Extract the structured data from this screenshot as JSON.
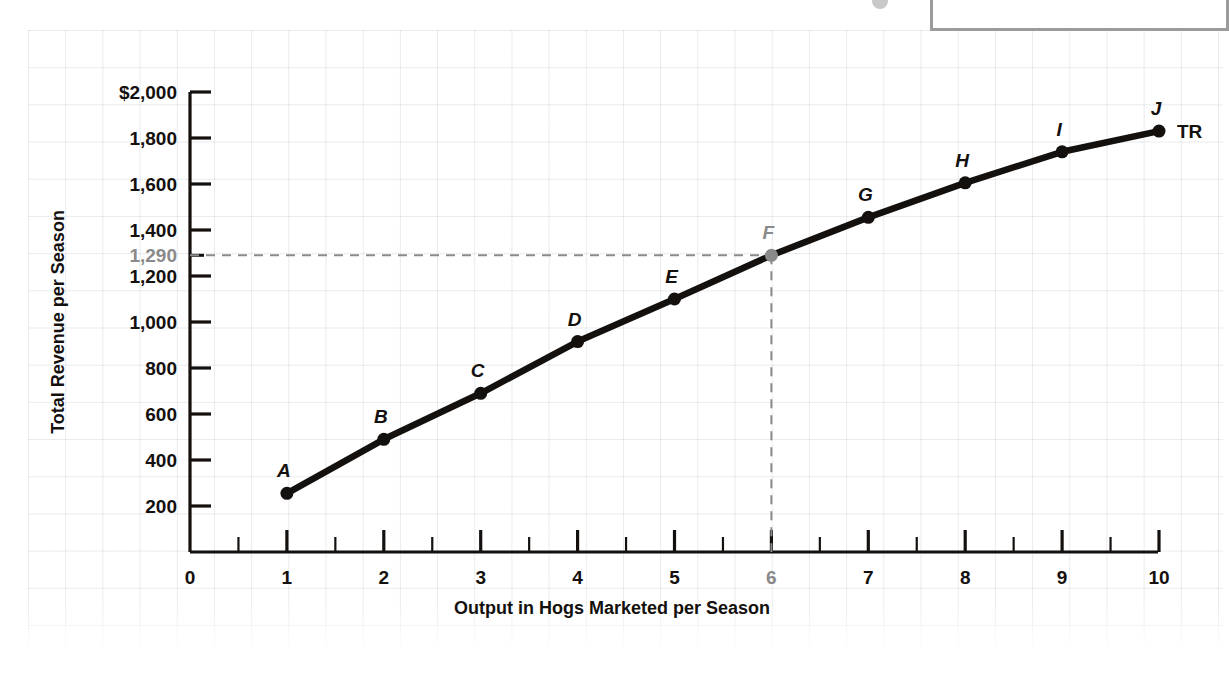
{
  "chart_data": {
    "type": "line",
    "title": "",
    "xlabel": "Output in Hogs Marketed per Season",
    "ylabel": "Total Revenue per Season",
    "series_name": "TR",
    "x": [
      1,
      2,
      3,
      4,
      5,
      6,
      7,
      8,
      9,
      10
    ],
    "values": [
      255,
      490,
      690,
      915,
      1100,
      1290,
      1455,
      1605,
      1740,
      1830
    ],
    "point_labels": [
      "A",
      "B",
      "C",
      "D",
      "E",
      "F",
      "G",
      "H",
      "I",
      "J"
    ],
    "xlim": [
      0,
      10
    ],
    "ylim": [
      0,
      2000
    ],
    "xticks": [
      "0",
      "1",
      "2",
      "3",
      "4",
      "5",
      "6",
      "7",
      "8",
      "9",
      "10"
    ],
    "yticks": [
      "$2,000",
      "1,800",
      "1,600",
      "1,400",
      "1,200",
      "1,000",
      "800",
      "600",
      "400",
      "200"
    ],
    "ytick_values": [
      2000,
      1800,
      1600,
      1400,
      1200,
      1000,
      800,
      600,
      400,
      200
    ],
    "grid": true,
    "legend": "none",
    "annotations": {
      "highlight_y_label": "1,290",
      "highlight_y_value": 1290,
      "highlight_x_label": "6",
      "highlight_x_value": 6,
      "highlight_point": "F",
      "guide_style": "dashed"
    },
    "colors": {
      "curve": "#14100e",
      "axis": "#14100e",
      "highlight": "#8a8a8a",
      "guide": "#8a8a8a",
      "grid": "#7b8291",
      "background": "#ffffff"
    }
  }
}
